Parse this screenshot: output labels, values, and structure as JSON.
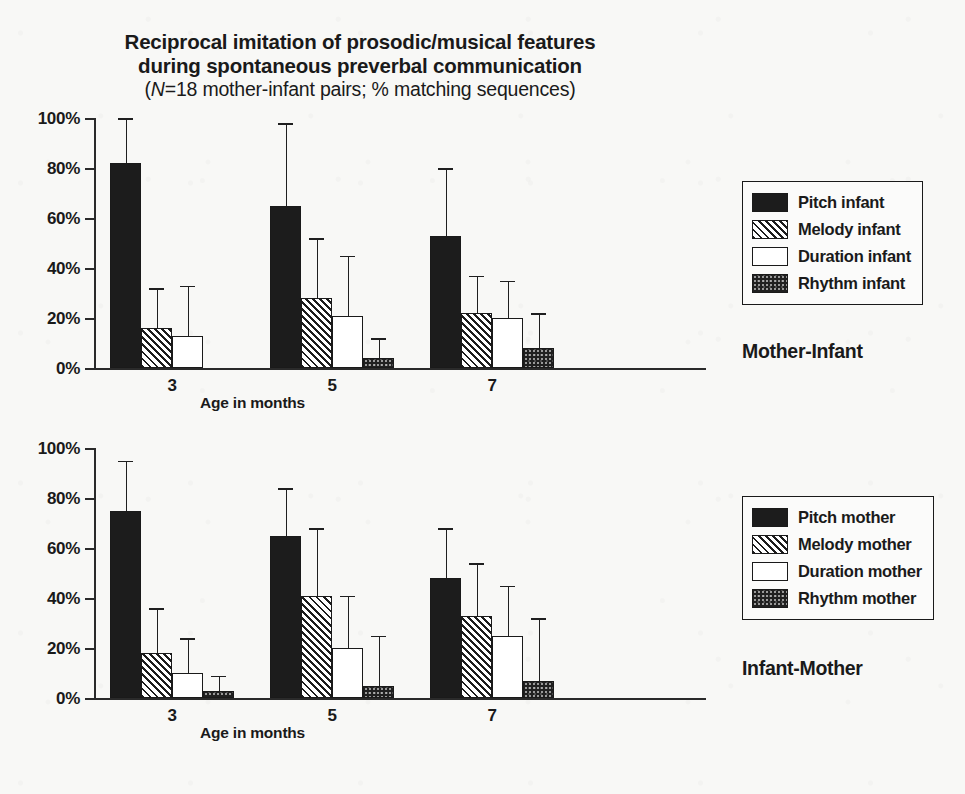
{
  "figure": {
    "title_line1": "Reciprocal imitation of prosodic/musical features",
    "title_line2": "during spontaneous preverbal communication",
    "title_sub_italic": "N",
    "title_sub_rest": "=18 mother-infant pairs; % matching sequences)",
    "title_sub_open": "(",
    "background_color": "#f8f8f6",
    "ink_color": "#1a1a1a"
  },
  "panels": [
    {
      "side_label": "Mother-Infant",
      "xlabel": "Age in months",
      "legend": [
        {
          "label": "Pitch infant",
          "pattern": "solid-black"
        },
        {
          "label": "Melody infant",
          "pattern": "diagonal-hatch"
        },
        {
          "label": "Duration infant",
          "pattern": "white"
        },
        {
          "label": "Rhythm infant",
          "pattern": "dotted-dark"
        }
      ]
    },
    {
      "side_label": "Infant-Mother",
      "xlabel": "Age in months",
      "legend": [
        {
          "label": "Pitch mother",
          "pattern": "solid-black"
        },
        {
          "label": "Melody mother",
          "pattern": "diagonal-hatch"
        },
        {
          "label": "Duration mother",
          "pattern": "white"
        },
        {
          "label": "Rhythm mother",
          "pattern": "dotted-dark"
        }
      ]
    }
  ],
  "chart_data": [
    {
      "type": "bar",
      "title": "Mother-Infant",
      "xlabel": "Age in months",
      "ylabel": "% matching sequences",
      "ylim": [
        0,
        100
      ],
      "ytick_labels": [
        "0%",
        "20%",
        "40%",
        "60%",
        "80%",
        "100%"
      ],
      "ytick_values": [
        0,
        20,
        40,
        60,
        80,
        100
      ],
      "categories": [
        "3",
        "5",
        "7"
      ],
      "grid": false,
      "legend_position": "right",
      "error_bars": "upper-only",
      "series": [
        {
          "name": "Pitch infant",
          "pattern": "solid-black",
          "values": [
            82,
            65,
            53
          ],
          "error_upper": [
            100,
            98,
            80
          ]
        },
        {
          "name": "Melody infant",
          "pattern": "diagonal-hatch",
          "values": [
            16,
            28,
            22
          ],
          "error_upper": [
            32,
            52,
            37
          ]
        },
        {
          "name": "Duration infant",
          "pattern": "white",
          "values": [
            13,
            21,
            20
          ],
          "error_upper": [
            33,
            45,
            35
          ]
        },
        {
          "name": "Rhythm infant",
          "pattern": "dotted-dark",
          "values": [
            0,
            4,
            8
          ],
          "error_upper": [
            0,
            12,
            22
          ]
        }
      ]
    },
    {
      "type": "bar",
      "title": "Infant-Mother",
      "xlabel": "Age in months",
      "ylabel": "% matching sequences",
      "ylim": [
        0,
        100
      ],
      "ytick_labels": [
        "0%",
        "20%",
        "40%",
        "60%",
        "80%",
        "100%"
      ],
      "ytick_values": [
        0,
        20,
        40,
        60,
        80,
        100
      ],
      "categories": [
        "3",
        "5",
        "7"
      ],
      "grid": false,
      "legend_position": "right",
      "error_bars": "upper-only",
      "series": [
        {
          "name": "Pitch mother",
          "pattern": "solid-black",
          "values": [
            75,
            65,
            48
          ],
          "error_upper": [
            95,
            84,
            68
          ]
        },
        {
          "name": "Melody mother",
          "pattern": "diagonal-hatch",
          "values": [
            18,
            41,
            33
          ],
          "error_upper": [
            36,
            68,
            54
          ]
        },
        {
          "name": "Duration mother",
          "pattern": "white",
          "values": [
            10,
            20,
            25
          ],
          "error_upper": [
            24,
            41,
            45
          ]
        },
        {
          "name": "Rhythm mother",
          "pattern": "dotted-dark",
          "values": [
            3,
            5,
            7
          ],
          "error_upper": [
            9,
            25,
            32
          ]
        }
      ]
    }
  ]
}
